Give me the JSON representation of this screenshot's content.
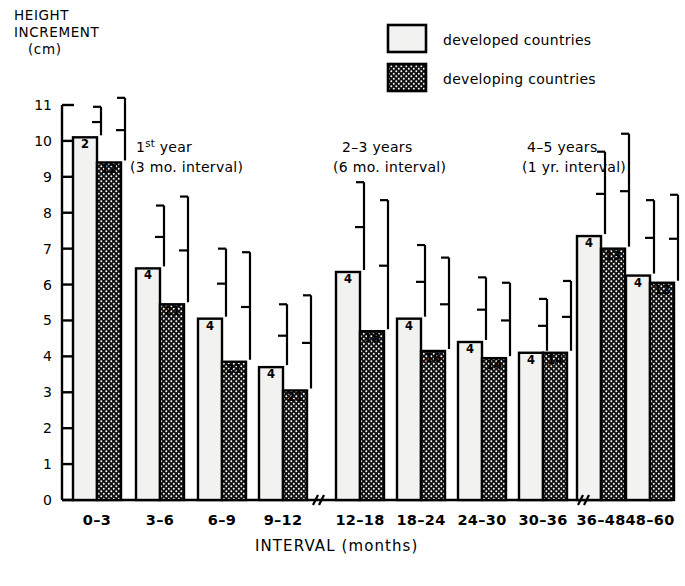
{
  "chart_data": {
    "type": "bar",
    "title": "",
    "ylabel": "HEIGHT INCREMENT (cm)",
    "ylabel_lines": [
      "HEIGHT",
      "INCREMENT",
      "(cm)"
    ],
    "xlabel": "INTERVAL (months)",
    "ylim": [
      0,
      11
    ],
    "ytick_labels": [
      "0",
      "1",
      "2",
      "3",
      "4",
      "5",
      "6",
      "7",
      "8",
      "9",
      "10",
      "11"
    ],
    "grid": false,
    "legend_position": "top-right",
    "axis_breaks": [
      "between 9-12 and 12-18",
      "between 30-36 and 36-48"
    ],
    "categories": [
      "0–3",
      "3–6",
      "6–9",
      "9–12",
      "12–18",
      "18–24",
      "24–30",
      "30–36",
      "36–48",
      "48–60"
    ],
    "series": [
      {
        "name": "developed countries",
        "color": "#f2f2f0",
        "pattern": "solid-light",
        "values": [
          10.1,
          6.45,
          5.05,
          3.7,
          6.35,
          5.05,
          4.4,
          4.1,
          7.35,
          6.25
        ],
        "sample_labels": [
          "2",
          "4",
          "4",
          "4",
          "4",
          "4",
          "4",
          "4",
          "4",
          "4"
        ],
        "error_upper": [
          10.95,
          8.2,
          7.0,
          5.45,
          8.85,
          7.1,
          6.2,
          5.6,
          9.7,
          8.35
        ]
      },
      {
        "name": "developing countries",
        "color": "#111111",
        "pattern": "dotted-dark",
        "values": [
          9.4,
          5.45,
          3.85,
          3.05,
          4.7,
          4.15,
          3.95,
          4.1,
          7.0,
          6.05
        ],
        "sample_labels": [
          "12",
          "21",
          "21",
          "21",
          "18",
          "16",
          "14",
          "14",
          "13",
          "12"
        ],
        "error_upper": [
          11.2,
          8.45,
          6.9,
          5.7,
          8.35,
          6.75,
          6.05,
          6.1,
          10.2,
          8.5
        ]
      }
    ],
    "panels": [
      {
        "line1": "1st year",
        "line1_sup": "st",
        "line1_pre": "1",
        "line1_post": " year",
        "line2": "(3 mo. interval)"
      },
      {
        "line1_pre": "2–3",
        "line1_post": " years",
        "line1": "2–3 years",
        "line2": "(6 mo. interval)"
      },
      {
        "line1_pre": "4–5",
        "line1_post": " years",
        "line1": "4–5 years",
        "line2": "(1 yr. interval)"
      }
    ]
  },
  "legend": {
    "items": [
      {
        "label": "developed  countries",
        "swatch": "light"
      },
      {
        "label": "developing  countries",
        "swatch": "dark"
      }
    ]
  }
}
